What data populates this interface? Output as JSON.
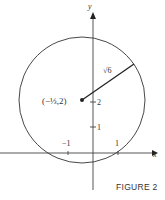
{
  "figure": {
    "caption": "FIGURE 2",
    "axes": {
      "x_label": "x",
      "y_label": "y",
      "x_ticks": [
        {
          "value": -1,
          "label": "−1"
        },
        {
          "value": 1,
          "label": "1"
        }
      ],
      "y_ticks": [
        {
          "value": 1,
          "label": "1"
        },
        {
          "value": 2,
          "label": "2"
        }
      ]
    },
    "circle": {
      "center_label": "(−⅓,2)",
      "center": [
        -0.3333,
        2
      ],
      "radius_label": "√6",
      "radius": 2.449
    },
    "colors": {
      "stroke": "#333333",
      "background": "#ffffff"
    }
  }
}
